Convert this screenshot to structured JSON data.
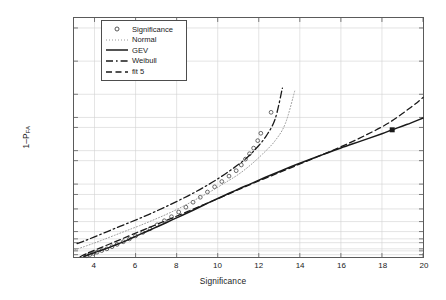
{
  "chart_data": {
    "type": "line",
    "title": "",
    "xlabel": "Significance",
    "ylabel": "1-P_FA",
    "xlim": [
      3,
      20
    ],
    "ylim_probability": [
      0.0003,
      0.9999995
    ],
    "grid": true,
    "legend_position": "upper-left-inside",
    "xticks": [
      4,
      6,
      8,
      10,
      12,
      14,
      16,
      18,
      20
    ],
    "xtick_labels": [
      "4",
      "6",
      "8",
      "10",
      "12",
      "14",
      "16",
      "18",
      "20"
    ],
    "ytick_values": [
      0.001,
      0.005,
      0.01,
      0.05,
      0.1,
      0.25,
      0.5,
      0.75,
      0.9,
      0.95,
      0.99,
      0.995,
      0.999,
      0.9995,
      0.9999,
      0.99999,
      0.999999
    ],
    "ytick_labels": [
      "0.001",
      "0.005",
      "0.01",
      "0.05",
      "0.1",
      "0.25",
      "0.5",
      "0.75",
      "0.9",
      "0.95",
      "0.99",
      "0.995",
      "0.999",
      "0.9995",
      "0.9999",
      "0.99999",
      "0.999999"
    ],
    "legend": [
      {
        "name": "Significance",
        "style": "circle-marker",
        "color": "#444444"
      },
      {
        "name": "Normal",
        "style": "dotted",
        "color": "#8c8c8c"
      },
      {
        "name": "GEV",
        "style": "solid",
        "color": "#1a1a1a"
      },
      {
        "name": "Weibull",
        "style": "dash-dot",
        "color": "#1a1a1a"
      },
      {
        "name": "fit 5",
        "style": "dashed",
        "color": "#1a1a1a"
      }
    ],
    "series": [
      {
        "name": "Significance",
        "style": "circle-marker",
        "points": [
          [
            3.62,
            0.0006
          ],
          [
            3.78,
            0.0011
          ],
          [
            3.95,
            0.0018
          ],
          [
            4.12,
            0.003
          ],
          [
            4.35,
            0.0055
          ],
          [
            4.6,
            0.01
          ],
          [
            4.85,
            0.019
          ],
          [
            5.1,
            0.034
          ],
          [
            5.4,
            0.06
          ],
          [
            5.7,
            0.1
          ],
          [
            6.0,
            0.155
          ],
          [
            6.35,
            0.23
          ],
          [
            6.7,
            0.32
          ],
          [
            7.05,
            0.42
          ],
          [
            7.4,
            0.52
          ],
          [
            7.75,
            0.61
          ],
          [
            8.1,
            0.7
          ],
          [
            8.45,
            0.775
          ],
          [
            8.8,
            0.835
          ],
          [
            9.15,
            0.88
          ],
          [
            9.5,
            0.915
          ],
          [
            9.85,
            0.94
          ],
          [
            10.2,
            0.958
          ],
          [
            10.55,
            0.971
          ],
          [
            10.9,
            0.98
          ],
          [
            11.15,
            0.9865
          ],
          [
            11.35,
            0.991
          ],
          [
            11.55,
            0.9938
          ],
          [
            11.75,
            0.9958
          ],
          [
            11.95,
            0.9975
          ],
          [
            12.1,
            0.9985
          ],
          [
            12.6,
            0.99965
          ]
        ]
      },
      {
        "name": "Normal",
        "style": "dotted",
        "points": [
          [
            3.05,
            0.0075
          ],
          [
            3.4,
            0.016
          ],
          [
            3.9,
            0.04
          ],
          [
            4.4,
            0.085
          ],
          [
            5.0,
            0.17
          ],
          [
            5.6,
            0.28
          ],
          [
            6.2,
            0.4
          ],
          [
            6.9,
            0.545
          ],
          [
            7.6,
            0.675
          ],
          [
            8.3,
            0.785
          ],
          [
            9.0,
            0.868
          ],
          [
            9.7,
            0.921
          ],
          [
            10.4,
            0.956
          ],
          [
            11.0,
            0.974
          ],
          [
            11.6,
            0.9865
          ],
          [
            12.2,
            0.9938
          ],
          [
            12.8,
            0.9975
          ],
          [
            13.3,
            0.99925
          ],
          [
            13.75,
            0.99992
          ]
        ]
      },
      {
        "name": "GEV",
        "style": "solid",
        "points": [
          [
            3.48,
            0.0004
          ],
          [
            3.7,
            0.001
          ],
          [
            3.95,
            0.0022
          ],
          [
            4.2,
            0.0045
          ],
          [
            4.5,
            0.0095
          ],
          [
            4.85,
            0.021
          ],
          [
            5.2,
            0.042
          ],
          [
            5.6,
            0.082
          ],
          [
            6.0,
            0.145
          ],
          [
            6.45,
            0.235
          ],
          [
            6.9,
            0.335
          ],
          [
            7.35,
            0.44
          ],
          [
            7.8,
            0.545
          ],
          [
            8.3,
            0.645
          ],
          [
            8.8,
            0.73
          ],
          [
            9.3,
            0.8
          ],
          [
            9.85,
            0.858
          ],
          [
            10.4,
            0.898
          ],
          [
            11.0,
            0.93
          ],
          [
            11.6,
            0.951
          ],
          [
            12.3,
            0.968
          ],
          [
            13.1,
            0.98
          ],
          [
            14.0,
            0.988
          ],
          [
            15.0,
            0.993
          ],
          [
            16.0,
            0.99585
          ],
          [
            17.0,
            0.99745
          ],
          [
            18.0,
            0.99845
          ],
          [
            18.5,
            0.99882
          ],
          [
            19.2,
            0.99918
          ],
          [
            20.0,
            0.99948
          ]
        ]
      },
      {
        "name": "Weibull",
        "style": "dash-dot",
        "points": [
          [
            3.15,
            0.041
          ],
          [
            3.55,
            0.075
          ],
          [
            4.0,
            0.135
          ],
          [
            4.5,
            0.225
          ],
          [
            5.05,
            0.34
          ],
          [
            5.6,
            0.455
          ],
          [
            6.2,
            0.575
          ],
          [
            6.85,
            0.69
          ],
          [
            7.5,
            0.785
          ],
          [
            8.15,
            0.857
          ],
          [
            8.8,
            0.908
          ],
          [
            9.45,
            0.944
          ],
          [
            10.1,
            0.968
          ],
          [
            10.7,
            0.982
          ],
          [
            11.3,
            0.9905
          ],
          [
            11.85,
            0.99555
          ],
          [
            12.35,
            0.99815
          ],
          [
            12.8,
            0.99945
          ],
          [
            13.15,
            0.999935
          ]
        ]
      },
      {
        "name": "fit 5",
        "style": "dashed",
        "points": [
          [
            3.3,
            0.00035
          ],
          [
            3.6,
            0.0016
          ],
          [
            3.95,
            0.0055
          ],
          [
            4.35,
            0.016
          ],
          [
            4.8,
            0.042
          ],
          [
            5.3,
            0.095
          ],
          [
            5.85,
            0.185
          ],
          [
            6.45,
            0.305
          ],
          [
            7.1,
            0.445
          ],
          [
            7.8,
            0.585
          ],
          [
            8.55,
            0.71
          ],
          [
            9.3,
            0.805
          ],
          [
            10.1,
            0.875
          ],
          [
            10.95,
            0.925
          ],
          [
            11.85,
            0.956
          ],
          [
            12.8,
            0.9745
          ],
          [
            13.8,
            0.9858
          ],
          [
            14.85,
            0.99235
          ],
          [
            15.95,
            0.99605
          ],
          [
            17.1,
            0.99815
          ],
          [
            18.3,
            0.99925
          ],
          [
            19.4,
            0.99975
          ],
          [
            20.0,
            0.999875
          ]
        ]
      }
    ],
    "highlight_markers": [
      {
        "series": "GEV",
        "x": 18.5,
        "y": 0.99882,
        "style": "filled-square",
        "color": "#1a1a1a"
      }
    ]
  }
}
